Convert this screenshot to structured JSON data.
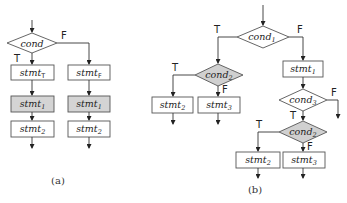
{
  "panels": [
    {
      "id": "a",
      "caption": "(a)",
      "cond": {
        "text": "cond"
      },
      "branch_true_label": "T",
      "branch_false_label": "F",
      "true_branch": [
        {
          "base": "stmt",
          "sub": "T",
          "shaded": false
        },
        {
          "base": "stmt",
          "sub": "1",
          "shaded": true
        },
        {
          "base": "stmt",
          "sub": "2",
          "shaded": false
        }
      ],
      "false_branch": [
        {
          "base": "stmt",
          "sub": "F",
          "shaded": false
        },
        {
          "base": "stmt",
          "sub": "1",
          "shaded": true
        },
        {
          "base": "stmt",
          "sub": "2",
          "shaded": false
        }
      ]
    },
    {
      "id": "b",
      "caption": "(b)",
      "cond1": {
        "base": "cond",
        "sub": "1"
      },
      "cond2_left": {
        "base": "cond",
        "sub": "2",
        "shaded": true
      },
      "stmt2_left": {
        "base": "stmt",
        "sub": "2"
      },
      "stmt3_left": {
        "base": "stmt",
        "sub": "3"
      },
      "stmt1": {
        "base": "stmt",
        "sub": "1"
      },
      "cond3": {
        "base": "cond",
        "sub": "3"
      },
      "cond2_right": {
        "base": "cond",
        "sub": "2",
        "shaded": true
      },
      "stmt2_right": {
        "base": "stmt",
        "sub": "2"
      },
      "stmt3_right": {
        "base": "stmt",
        "sub": "3"
      },
      "label_T": "T",
      "label_F": "F"
    }
  ],
  "colors": {
    "line": "#333333",
    "box_border": "#555555",
    "shaded_fill": "#d4d4d4",
    "background": "#ffffff"
  }
}
